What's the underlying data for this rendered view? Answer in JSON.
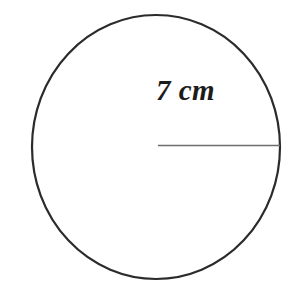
{
  "figure": {
    "type": "geometry-diagram",
    "background_color": "#ffffff",
    "width": 301,
    "height": 301,
    "shape": {
      "name": "circle",
      "center_x": 156,
      "center_y": 147,
      "radius_x": 124,
      "radius_y": 132,
      "stroke_color": "#2b2b2b",
      "stroke_width": 2.2,
      "fill_color": "none"
    },
    "radius_segment": {
      "name": "radius-line",
      "x1": 158,
      "y1": 145,
      "x2": 280,
      "y2": 145,
      "stroke_color": "#6e6e6e",
      "stroke_width": 1.4
    },
    "label": {
      "text": "7 cm",
      "value": 7,
      "unit": "cm",
      "measure": "radius",
      "color": "#1c1c1c",
      "x": 156,
      "y": 76
    }
  }
}
